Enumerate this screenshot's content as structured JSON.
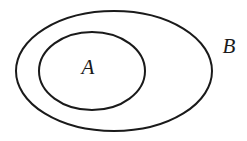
{
  "figure": {
    "type": "venn-diagram",
    "background_color": "#ffffff",
    "stroke_color": "#1a1a1a",
    "stroke_width": 2,
    "width": 247,
    "height": 141
  },
  "sets": [
    {
      "id": "outer-set",
      "label": "B",
      "shape": "ellipse",
      "cx": 114,
      "cy": 71,
      "rx": 98,
      "ry": 60,
      "label_x": 229,
      "label_y": 48,
      "label_position": "outside-upper-right"
    },
    {
      "id": "inner-set",
      "label": "A",
      "shape": "ellipse",
      "cx": 92,
      "cy": 71,
      "rx": 53,
      "ry": 39,
      "label_x": 88,
      "label_y": 69,
      "label_position": "center"
    }
  ]
}
